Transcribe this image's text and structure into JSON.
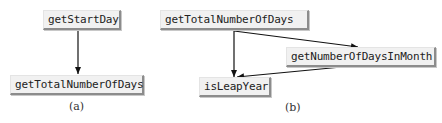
{
  "diagrams": [
    {
      "caption": "(a)",
      "nodes": {
        "start": "getStartDay",
        "total": "getTotalNumberOfDays"
      },
      "edges": [
        {
          "from": "getStartDay",
          "to": "getTotalNumberOfDays"
        }
      ]
    },
    {
      "caption": "(b)",
      "nodes": {
        "total": "getTotalNumberOfDays",
        "month": "getNumberOfDaysInMonth",
        "leap": "isLeapYear"
      },
      "edges": [
        {
          "from": "getTotalNumberOfDays",
          "to": "getNumberOfDaysInMonth"
        },
        {
          "from": "getTotalNumberOfDays",
          "to": "isLeapYear"
        },
        {
          "from": "getNumberOfDaysInMonth",
          "to": "isLeapYear"
        }
      ]
    }
  ],
  "colors": {
    "node_fill": "#f1f1f1",
    "node_shadow": "#8c8c8c",
    "edge": "#111111",
    "text": "#222222"
  }
}
